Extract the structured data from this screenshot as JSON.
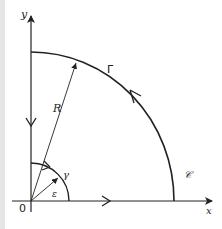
{
  "diagram": {
    "type": "contour-integration-quarter-circle",
    "labels": {
      "y_axis": "y",
      "x_axis": "x",
      "origin": "0",
      "radius": "R",
      "big_arc": "Γ",
      "small_arc": "γ",
      "small_radius": "ε",
      "contour": "𝒞"
    },
    "colors": {
      "stroke": "#222222",
      "background": "#ffffff",
      "left_strip": "#e6e6e6"
    }
  }
}
